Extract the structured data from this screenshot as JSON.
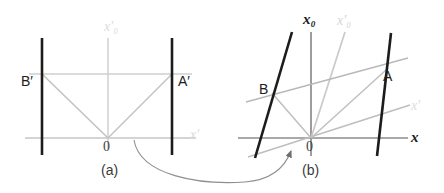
{
  "figure": {
    "type": "spacetime-diagram",
    "colors": {
      "black": "#1a1a1a",
      "dark_gray": "#3a3a3a",
      "mid_gray": "#8a8a8a",
      "light_gray": "#c8c8c8",
      "very_light_gray": "#dcdcdc",
      "background": "#ffffff"
    }
  },
  "panel_a": {
    "caption": "(a)",
    "labels": {
      "origin": "0",
      "point_b": "B",
      "point_b_prime": "′",
      "point_a": "A",
      "point_a_prime": "′",
      "axis_time": "x",
      "axis_time_sub": "0",
      "axis_time_prime": "′",
      "axis_space": "x",
      "axis_space_prime": "′"
    },
    "text": {
      "b_label": "B′",
      "a_label": "A′",
      "origin_label": "0",
      "vertical_axis_label": "x′₀",
      "horizontal_axis_label": "x′"
    }
  },
  "panel_b": {
    "caption": "(b)",
    "text": {
      "b_label": "B",
      "a_label": "A",
      "origin_label": "0",
      "vertical_axis_label": "x₀",
      "slanted_axis_label": "x′₀",
      "horizontal_axis_label": "x",
      "slanted_space_axis_label": "x′"
    }
  },
  "connector": {
    "name": "transformation-arrow",
    "description": "curved arrow from panel (a) to panel (b)"
  }
}
